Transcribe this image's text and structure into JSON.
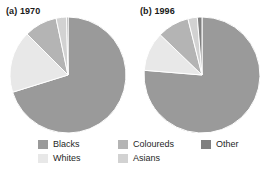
{
  "chart_data": [
    {
      "type": "pie",
      "title": "(a) 1970",
      "categories": [
        "Blacks",
        "Whites",
        "Coloureds",
        "Asians",
        "Other"
      ],
      "values": [
        70.2,
        17.3,
        9.2,
        2.9,
        0.4
      ],
      "colors": [
        "#9a9a9a",
        "#e8e8e8",
        "#b4b4b4",
        "#d2d2d2",
        "#808080"
      ],
      "start_angle": 0,
      "direction": "clockwise",
      "legend_position": "bottom",
      "grid": false,
      "xlabel": "",
      "ylabel": ""
    },
    {
      "type": "pie",
      "title": "(b) 1996",
      "categories": [
        "Blacks",
        "Whites",
        "Coloureds",
        "Asians",
        "Other"
      ],
      "values": [
        76.3,
        10.9,
        8.9,
        2.6,
        1.3
      ],
      "colors": [
        "#9a9a9a",
        "#e8e8e8",
        "#b4b4b4",
        "#d2d2d2",
        "#808080"
      ],
      "start_angle": 0,
      "direction": "clockwise",
      "legend_position": "bottom",
      "grid": false,
      "xlabel": "",
      "ylabel": ""
    }
  ],
  "titles": {
    "chart_a": "(a) 1970",
    "chart_b": "(b) 1996"
  },
  "legend": {
    "items": [
      {
        "label": "Blacks",
        "color": "#9a9a9a"
      },
      {
        "label": "Whites",
        "color": "#e8e8e8"
      },
      {
        "label": "Coloureds",
        "color": "#b4b4b4"
      },
      {
        "label": "Asians",
        "color": "#d2d2d2"
      },
      {
        "label": "Other",
        "color": "#808080"
      }
    ]
  },
  "style": {
    "background": "#ffffff",
    "separator_color": "#ffffff",
    "text_color": "#1f1f1f"
  }
}
